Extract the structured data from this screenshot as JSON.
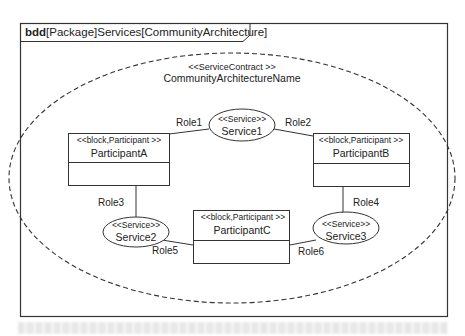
{
  "frame": {
    "kind": "bdd",
    "title": "[Package]Services[CommunityArchitecture]"
  },
  "contract": {
    "stereotype": "<<ServiceContract >>",
    "name": "CommunityArchitectureName"
  },
  "blocks": [
    {
      "id": "A",
      "stereotype": "<<block,Participant >>",
      "name": "ParticipantA"
    },
    {
      "id": "B",
      "stereotype": "<<block,Participant >>",
      "name": "ParticipantB"
    },
    {
      "id": "C",
      "stereotype": "<<block,Participant >>",
      "name": "ParticipantC"
    }
  ],
  "services": [
    {
      "id": "S1",
      "stereotype": "<<Service>>",
      "name": "Service1"
    },
    {
      "id": "S2",
      "stereotype": "<<Service>>",
      "name": "Service2"
    },
    {
      "id": "S3",
      "stereotype": "<<Service>>",
      "name": "Service3"
    }
  ],
  "roles": [
    "Role1",
    "Role2",
    "Role3",
    "Role4",
    "Role5",
    "Role6"
  ],
  "colors": {
    "line": "#333333",
    "background": "#ffffff"
  }
}
